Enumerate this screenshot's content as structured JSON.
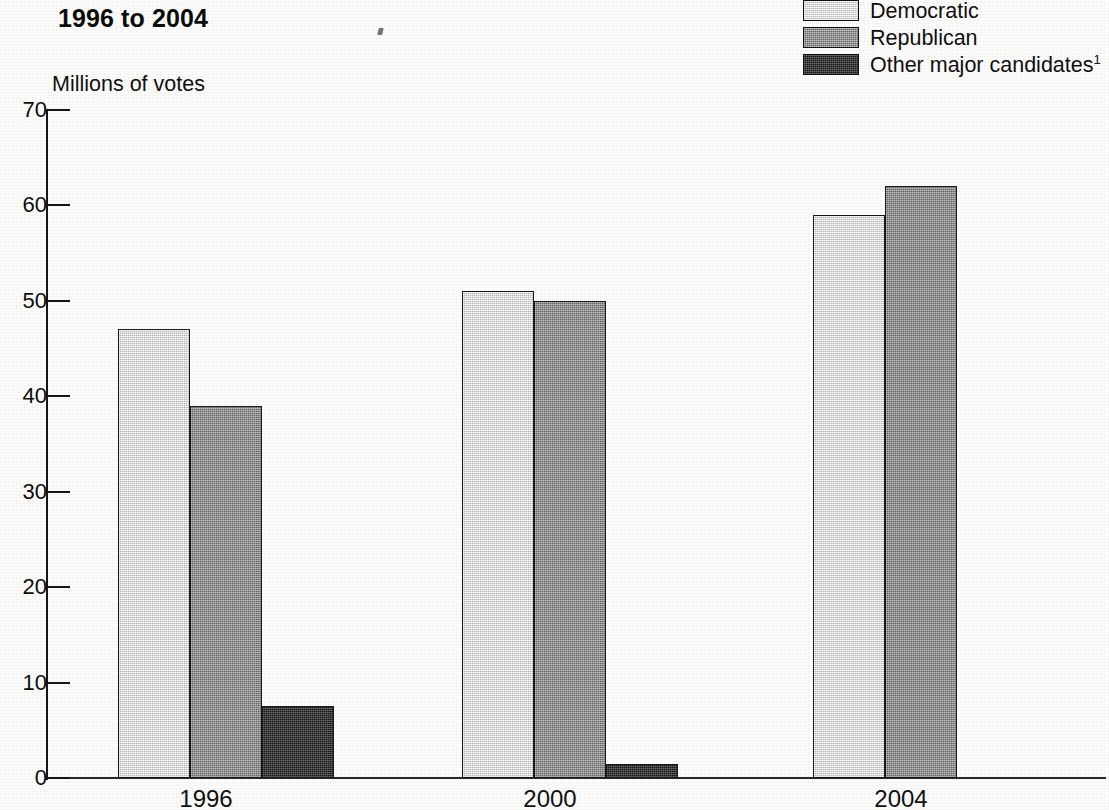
{
  "title": {
    "line1": "Votes cast for president, by major party,",
    "line2": "1996 to 2004",
    "line1_visible": false
  },
  "axis_unit_label": "Millions of votes",
  "legend": {
    "items": [
      {
        "label": "Democratic",
        "color": "#d2d2d2",
        "footnote": ""
      },
      {
        "label": "Republican",
        "color": "#8d8d8d",
        "footnote": ""
      },
      {
        "label": "Other major candidates",
        "color": "#3b3b3b",
        "footnote": "1"
      }
    ]
  },
  "chart_data": {
    "type": "bar",
    "title": "Votes cast for president, by major party, 1996 to 2004",
    "xlabel": "",
    "ylabel": "Millions of votes",
    "ylim": [
      0,
      70
    ],
    "yticks": [
      0,
      10,
      20,
      30,
      40,
      50,
      60,
      70
    ],
    "ytick_labels": [
      "0",
      "10",
      "20",
      "30",
      "40",
      "50",
      "60",
      "70"
    ],
    "grid": false,
    "legend_position": "top-right",
    "categories": [
      "1996",
      "2000",
      "2004"
    ],
    "series": [
      {
        "name": "Democratic",
        "color": "#d2d2d2",
        "values": [
          47,
          51,
          59
        ]
      },
      {
        "name": "Republican",
        "color": "#8d8d8d",
        "values": [
          39,
          50,
          62
        ]
      },
      {
        "name": "Other major candidates",
        "color": "#3b3b3b",
        "values": [
          7.5,
          1.5,
          0
        ]
      }
    ]
  },
  "geometry": {
    "y_zero_px": 778,
    "y_top_px": 110,
    "axis_x_px": 46,
    "bar_width_px": 72,
    "groups": [
      {
        "category": "1996",
        "start_x_px": 118,
        "label_center_px": 206
      },
      {
        "category": "2000",
        "start_x_px": 462,
        "label_center_px": 550
      },
      {
        "category": "2004",
        "start_x_px": 813,
        "label_center_px": 901
      }
    ]
  }
}
